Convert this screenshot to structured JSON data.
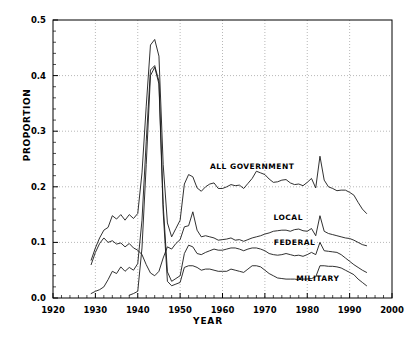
{
  "chart_data": {
    "type": "line",
    "title": "",
    "xlabel": "YEAR",
    "ylabel": "PROPORTION",
    "xlim": [
      1920,
      2000
    ],
    "ylim": [
      0.0,
      0.5
    ],
    "xticks": [
      1920,
      1930,
      1940,
      1950,
      1960,
      1970,
      1980,
      1990,
      2000
    ],
    "xtick_labels": [
      "1920",
      "1930",
      "1940",
      "1950",
      "1960",
      "1970",
      "1980",
      "1990",
      "2000"
    ],
    "yticks": [
      0.0,
      0.1,
      0.2,
      0.3,
      0.4,
      0.5
    ],
    "ytick_labels": [
      "0.0",
      "0.1",
      "0.2",
      "0.3",
      "0.4",
      "0.5"
    ],
    "grid": "dotted-major-both",
    "minor_ticks": true,
    "legend_position": "inline-annotations",
    "line_color": "#1a1a1a",
    "series": [
      {
        "name": "ALL GOVERNMENT",
        "label_x": 1967.0,
        "label_y": 0.232,
        "x": [
          1929,
          1930,
          1931,
          1932,
          1933,
          1934,
          1935,
          1936,
          1937,
          1938,
          1939,
          1940,
          1941,
          1942,
          1943,
          1944,
          1945,
          1946,
          1947,
          1948,
          1949,
          1950,
          1951,
          1952,
          1953,
          1954,
          1955,
          1956,
          1957,
          1958,
          1959,
          1960,
          1961,
          1962,
          1963,
          1964,
          1965,
          1966,
          1967,
          1968,
          1969,
          1970,
          1971,
          1972,
          1973,
          1974,
          1975,
          1976,
          1977,
          1978,
          1979,
          1980,
          1981,
          1982,
          1983,
          1984,
          1985,
          1986,
          1987,
          1988,
          1989,
          1990,
          1991,
          1992,
          1993,
          1994
        ],
        "y": [
          0.068,
          0.09,
          0.108,
          0.122,
          0.127,
          0.148,
          0.142,
          0.15,
          0.14,
          0.15,
          0.143,
          0.152,
          0.225,
          0.345,
          0.455,
          0.465,
          0.435,
          0.24,
          0.135,
          0.11,
          0.125,
          0.14,
          0.205,
          0.222,
          0.218,
          0.198,
          0.192,
          0.2,
          0.205,
          0.207,
          0.197,
          0.197,
          0.2,
          0.204,
          0.202,
          0.203,
          0.197,
          0.206,
          0.215,
          0.228,
          0.225,
          0.222,
          0.214,
          0.208,
          0.209,
          0.212,
          0.213,
          0.207,
          0.204,
          0.205,
          0.202,
          0.208,
          0.215,
          0.198,
          0.255,
          0.212,
          0.2,
          0.197,
          0.193,
          0.194,
          0.194,
          0.19,
          0.185,
          0.172,
          0.16,
          0.152
        ]
      },
      {
        "name": "LOCAL",
        "label_x": 1975.5,
        "label_y": 0.14,
        "x": [
          1929,
          1930,
          1931,
          1932,
          1933,
          1934,
          1935,
          1936,
          1937,
          1938,
          1939,
          1940,
          1941,
          1942,
          1943,
          1944,
          1945,
          1946,
          1947,
          1948,
          1949,
          1950,
          1951,
          1952,
          1953,
          1954,
          1955,
          1956,
          1957,
          1958,
          1959,
          1960,
          1961,
          1962,
          1963,
          1964,
          1965,
          1966,
          1967,
          1968,
          1969,
          1970,
          1971,
          1972,
          1973,
          1974,
          1975,
          1976,
          1977,
          1978,
          1979,
          1980,
          1981,
          1982,
          1983,
          1984,
          1985,
          1986,
          1987,
          1988,
          1989,
          1990,
          1991,
          1992,
          1993,
          1994
        ],
        "y": [
          0.06,
          0.082,
          0.098,
          0.108,
          0.1,
          0.103,
          0.097,
          0.099,
          0.092,
          0.098,
          0.09,
          0.086,
          0.078,
          0.06,
          0.045,
          0.04,
          0.048,
          0.072,
          0.092,
          0.088,
          0.098,
          0.105,
          0.128,
          0.13,
          0.155,
          0.122,
          0.11,
          0.112,
          0.11,
          0.108,
          0.104,
          0.105,
          0.106,
          0.108,
          0.104,
          0.105,
          0.102,
          0.105,
          0.108,
          0.11,
          0.112,
          0.115,
          0.117,
          0.12,
          0.121,
          0.122,
          0.122,
          0.12,
          0.123,
          0.124,
          0.121,
          0.12,
          0.125,
          0.112,
          0.148,
          0.12,
          0.116,
          0.114,
          0.112,
          0.11,
          0.108,
          0.107,
          0.104,
          0.1,
          0.096,
          0.094
        ]
      },
      {
        "name": "FEDERAL",
        "label_x": 1977.0,
        "label_y": 0.095,
        "x": [
          1929,
          1930,
          1931,
          1932,
          1933,
          1934,
          1935,
          1936,
          1937,
          1938,
          1939,
          1940,
          1941,
          1942,
          1943,
          1944,
          1945,
          1946,
          1947,
          1948,
          1949,
          1950,
          1951,
          1952,
          1953,
          1954,
          1955,
          1956,
          1957,
          1958,
          1959,
          1960,
          1961,
          1962,
          1963,
          1964,
          1965,
          1966,
          1967,
          1968,
          1969,
          1970,
          1971,
          1972,
          1973,
          1974,
          1975,
          1976,
          1977,
          1978,
          1979,
          1980,
          1981,
          1982,
          1983,
          1984,
          1985,
          1986,
          1987,
          1988,
          1989,
          1990,
          1991,
          1992,
          1993,
          1994
        ],
        "y": [
          0.008,
          0.012,
          0.015,
          0.02,
          0.033,
          0.048,
          0.044,
          0.056,
          0.048,
          0.055,
          0.05,
          0.062,
          0.14,
          0.282,
          0.41,
          0.418,
          0.39,
          0.168,
          0.047,
          0.03,
          0.035,
          0.04,
          0.08,
          0.095,
          0.092,
          0.08,
          0.078,
          0.082,
          0.085,
          0.088,
          0.086,
          0.086,
          0.088,
          0.09,
          0.09,
          0.088,
          0.085,
          0.088,
          0.09,
          0.09,
          0.088,
          0.085,
          0.08,
          0.078,
          0.077,
          0.078,
          0.08,
          0.078,
          0.076,
          0.077,
          0.075,
          0.078,
          0.082,
          0.078,
          0.1,
          0.085,
          0.084,
          0.083,
          0.082,
          0.078,
          0.072,
          0.066,
          0.06,
          0.055,
          0.05,
          0.046
        ]
      },
      {
        "name": "MILITARY",
        "label_x": 1982.5,
        "label_y": 0.03,
        "x": [
          1938,
          1939,
          1940,
          1941,
          1942,
          1943,
          1944,
          1945,
          1946,
          1947,
          1948,
          1949,
          1950,
          1951,
          1952,
          1953,
          1954,
          1955,
          1956,
          1957,
          1958,
          1959,
          1960,
          1961,
          1962,
          1963,
          1964,
          1965,
          1966,
          1967,
          1968,
          1969,
          1970,
          1971,
          1972,
          1973,
          1974,
          1975,
          1976,
          1977,
          1978,
          1979,
          1980,
          1981,
          1982,
          1983,
          1984,
          1985,
          1986,
          1987,
          1988,
          1989,
          1990,
          1991,
          1992,
          1993,
          1994
        ],
        "y": [
          0.005,
          0.008,
          0.012,
          0.09,
          0.24,
          0.4,
          0.415,
          0.385,
          0.155,
          0.03,
          0.022,
          0.025,
          0.028,
          0.055,
          0.058,
          0.058,
          0.055,
          0.05,
          0.052,
          0.052,
          0.05,
          0.048,
          0.048,
          0.048,
          0.052,
          0.05,
          0.048,
          0.046,
          0.052,
          0.058,
          0.058,
          0.056,
          0.05,
          0.044,
          0.04,
          0.036,
          0.035,
          0.034,
          0.034,
          0.034,
          0.033,
          0.034,
          0.034,
          0.035,
          0.038,
          0.058,
          0.058,
          0.057,
          0.057,
          0.056,
          0.054,
          0.05,
          0.046,
          0.042,
          0.034,
          0.028,
          0.022
        ]
      }
    ]
  }
}
